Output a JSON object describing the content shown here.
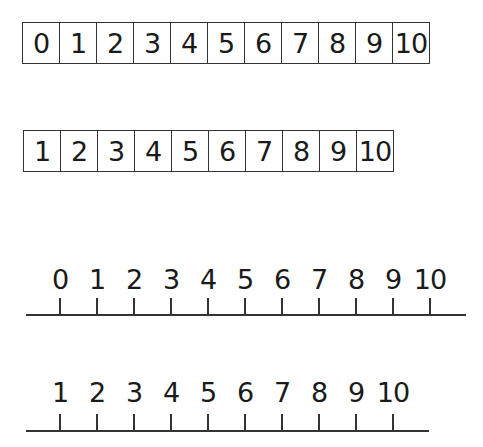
{
  "box_strip_0_to_10": {
    "cells": [
      "0",
      "1",
      "2",
      "3",
      "4",
      "5",
      "6",
      "7",
      "8",
      "9",
      "10"
    ]
  },
  "box_strip_1_to_10": {
    "cells": [
      "1",
      "2",
      "3",
      "4",
      "5",
      "6",
      "7",
      "8",
      "9",
      "10"
    ]
  },
  "number_line_0_to_10": {
    "labels": [
      "0",
      "1",
      "2",
      "3",
      "4",
      "5",
      "6",
      "7",
      "8",
      "9",
      "10"
    ]
  },
  "number_line_1_to_10": {
    "labels": [
      "1",
      "2",
      "3",
      "4",
      "5",
      "6",
      "7",
      "8",
      "9",
      "10"
    ]
  }
}
